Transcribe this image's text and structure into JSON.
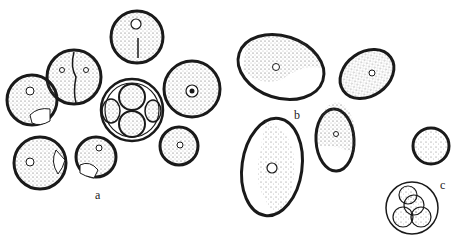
{
  "figure": {
    "panels": [
      {
        "label": "a",
        "x": 95,
        "y": 188
      },
      {
        "label": "b",
        "x": 294,
        "y": 108
      },
      {
        "label": "c",
        "x": 440,
        "y": 178
      }
    ]
  },
  "colors": {
    "ink": "#1a1a1a",
    "stipple": "#555555",
    "background": "#ffffff"
  }
}
